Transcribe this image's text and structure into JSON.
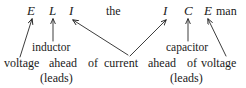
{
  "figure": {
    "background_color": "#ffffff",
    "ink_color": "#1a1a1a",
    "width": 246,
    "height": 88
  },
  "mnemonic": {
    "letters": [
      {
        "id": "E1",
        "text": "E",
        "style": "italic"
      },
      {
        "id": "L",
        "text": "L",
        "style": "italic"
      },
      {
        "id": "I1",
        "text": "I",
        "style": "italic"
      },
      {
        "id": "I2",
        "text": "I",
        "style": "italic"
      },
      {
        "id": "C",
        "text": "C",
        "style": "italic"
      },
      {
        "id": "E2",
        "text": "E",
        "style": "italic"
      }
    ],
    "the": "the",
    "man": "man"
  },
  "labels": {
    "inductor": "inductor",
    "capacitor": "capacitor"
  },
  "explanation": {
    "left": {
      "voltage": "voltage",
      "ahead": "ahead",
      "of": "of"
    },
    "current": "current",
    "right": {
      "ahead": "ahead",
      "of": "of",
      "voltage": "voltage"
    }
  },
  "leads": {
    "left": "(leads)",
    "right": "(leads)"
  },
  "arrows": [
    {
      "name": "arrow-voltage-to-E1",
      "from": [
        20,
        57
      ],
      "to": [
        32,
        19
      ],
      "points_at": "E1"
    },
    {
      "name": "arrow-inductor-to-L",
      "from": [
        53,
        41
      ],
      "to": [
        53,
        19
      ],
      "points_at": "L"
    },
    {
      "name": "arrow-current-to-I1",
      "from": [
        128,
        55
      ],
      "to": [
        73,
        20
      ],
      "points_at": "I1"
    },
    {
      "name": "arrow-current-to-I2",
      "from": [
        130,
        56
      ],
      "to": [
        166,
        20
      ],
      "points_at": "I2"
    },
    {
      "name": "arrow-capacitor-to-C",
      "from": [
        188,
        41
      ],
      "to": [
        188,
        19
      ],
      "points_at": "C"
    },
    {
      "name": "arrow-voltage-to-E2",
      "from": [
        226,
        56
      ],
      "to": [
        208,
        19
      ],
      "points_at": "E2"
    }
  ]
}
